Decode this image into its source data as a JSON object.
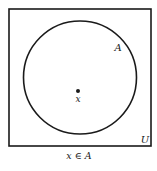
{
  "diagram": {
    "type": "venn",
    "universe": {
      "label": "U",
      "x": 9,
      "y": 9,
      "width": 142,
      "height": 137
    },
    "set": {
      "label": "A",
      "cx": 80,
      "cy": 77.5,
      "r": 56.5
    },
    "element": {
      "label": "x",
      "cx": 78,
      "cy": 91
    },
    "caption": "x ∈ A",
    "colors": {
      "stroke": "#1a1a1a",
      "background": "#ffffff"
    }
  }
}
